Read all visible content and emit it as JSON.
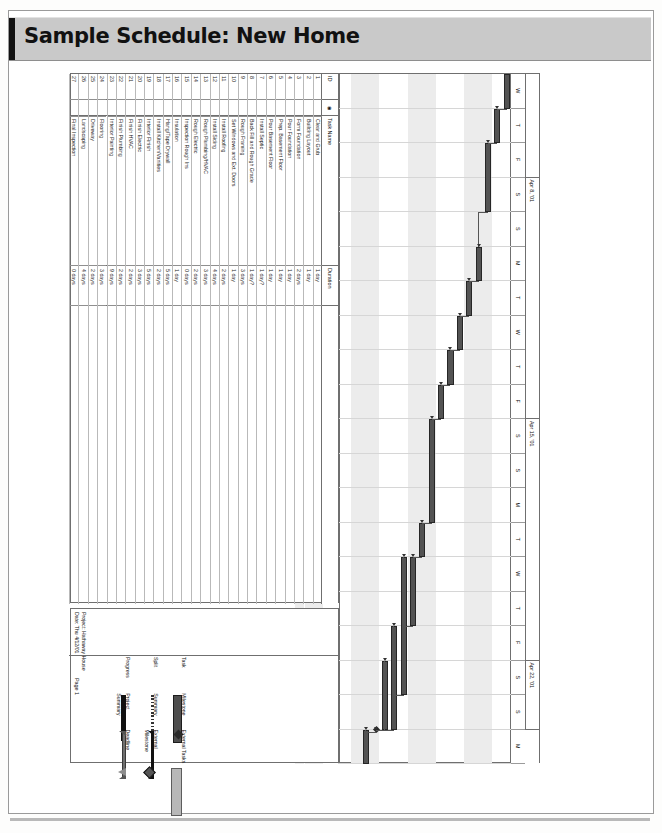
{
  "banner": {
    "title": "Sample Schedule: New Home"
  },
  "table": {
    "headers": {
      "id": "ID",
      "icon": "info-icon",
      "name": "Task Name",
      "duration": "Duration"
    },
    "rows": [
      {
        "id": "1",
        "name": "Clear and Grub",
        "duration": "1 day"
      },
      {
        "id": "2",
        "name": "Building Layout",
        "duration": "1 day"
      },
      {
        "id": "3",
        "name": "Form Foundation",
        "duration": "2 days"
      },
      {
        "id": "4",
        "name": "Pour Foundation",
        "duration": "1 day"
      },
      {
        "id": "5",
        "name": "Prep. Basement Floor",
        "duration": "1 day"
      },
      {
        "id": "6",
        "name": "Pour Basement Floor",
        "duration": "1 day"
      },
      {
        "id": "7",
        "name": "Install Septic",
        "duration": "1 day?"
      },
      {
        "id": "8",
        "name": "Back Fill and Rough Grade",
        "duration": "1 day?"
      },
      {
        "id": "9",
        "name": "Rough Framing",
        "duration": "3 days"
      },
      {
        "id": "10",
        "name": "Set Windows and Ext. Doors",
        "duration": "1 day"
      },
      {
        "id": "11",
        "name": "Install Roofing",
        "duration": "2 days"
      },
      {
        "id": "12",
        "name": "Install Siding",
        "duration": "4 days"
      },
      {
        "id": "13",
        "name": "Rough Plumbing/HVAC",
        "duration": "3 days"
      },
      {
        "id": "14",
        "name": "Rough Electric",
        "duration": "2 days"
      },
      {
        "id": "15",
        "name": "Inspection Rough Ins",
        "duration": "0 days"
      },
      {
        "id": "16",
        "name": "Insulation",
        "duration": "1 day"
      },
      {
        "id": "17",
        "name": "Hang/Tape  Drywall",
        "duration": "5 days"
      },
      {
        "id": "18",
        "name": "Install Kitchen/Vanities",
        "duration": "2 days"
      },
      {
        "id": "19",
        "name": "Interior Finish",
        "duration": "5 days"
      },
      {
        "id": "20",
        "name": "Finish Electric",
        "duration": "3 days"
      },
      {
        "id": "21",
        "name": "Finish HVAC",
        "duration": "2 days"
      },
      {
        "id": "22",
        "name": "Finish Plumbing",
        "duration": "2 days"
      },
      {
        "id": "23",
        "name": "Interior Painting",
        "duration": "9 days"
      },
      {
        "id": "24",
        "name": "Flooring",
        "duration": "3 days"
      },
      {
        "id": "25",
        "name": "Driveway",
        "duration": "2 days"
      },
      {
        "id": "26",
        "name": "Landscaping",
        "duration": "4 days"
      },
      {
        "id": "27",
        "name": "Final Inspection",
        "duration": "0 days"
      }
    ]
  },
  "timeline": {
    "weeks": [
      {
        "label": "",
        "days": 3
      },
      {
        "label": "Apr 8, '01",
        "days": 7
      },
      {
        "label": "Apr 15, '01",
        "days": 7
      },
      {
        "label": "Apr 22, '01",
        "days": 2
      }
    ],
    "days": [
      "W",
      "T",
      "F",
      "S",
      "S",
      "M",
      "T",
      "W",
      "T",
      "F",
      "S",
      "S",
      "M",
      "T",
      "W",
      "T",
      "F",
      "S",
      "S",
      "M"
    ]
  },
  "chart_data": {
    "type": "bar",
    "title": "Sample Schedule: New Home",
    "bars": [
      {
        "row": 1,
        "start": 0,
        "len": 1
      },
      {
        "row": 2,
        "start": 1,
        "len": 1
      },
      {
        "row": 3,
        "start": 2,
        "len": 2
      },
      {
        "row": 4,
        "start": 5,
        "len": 1
      },
      {
        "row": 5,
        "start": 6,
        "len": 1
      },
      {
        "row": 6,
        "start": 7,
        "len": 1
      },
      {
        "row": 7,
        "start": 8,
        "len": 1
      },
      {
        "row": 8,
        "start": 9,
        "len": 1
      },
      {
        "row": 9,
        "start": 10,
        "len": 3
      },
      {
        "row": 10,
        "start": 13,
        "len": 1
      },
      {
        "row": 11,
        "start": 14,
        "len": 2
      },
      {
        "row": 12,
        "start": 14,
        "len": 4
      },
      {
        "row": 13,
        "start": 16,
        "len": 3
      },
      {
        "row": 14,
        "start": 17,
        "len": 2
      },
      {
        "row": 15,
        "start": 19,
        "len": 0
      },
      {
        "row": 16,
        "start": 19,
        "len": 1
      }
    ],
    "xlabel": "",
    "ylabel": "",
    "grid": true
  },
  "legend": {
    "col1": [
      {
        "label": "Task",
        "swatch": "task-bar"
      },
      {
        "label": "Split",
        "swatch": "split-bar"
      },
      {
        "label": "Progress",
        "swatch": "progress-bar"
      }
    ],
    "col2": [
      {
        "label": "Milestone",
        "swatch": "milestone-diamond"
      },
      {
        "label": "Summary",
        "swatch": "summary-bar"
      },
      {
        "label": "Project Summary",
        "swatch": "project-summary-bar"
      }
    ],
    "col3": [
      {
        "label": "External Tasks",
        "swatch": "external-task-bar"
      },
      {
        "label": "External Milestone",
        "swatch": "external-milestone-diamond"
      },
      {
        "label": "Deadline",
        "swatch": "deadline-arrow"
      }
    ],
    "page_number": "Page 1"
  },
  "project": {
    "line1": "Project: Hathaway House",
    "line2": "Date: Thu 4/12/01"
  }
}
